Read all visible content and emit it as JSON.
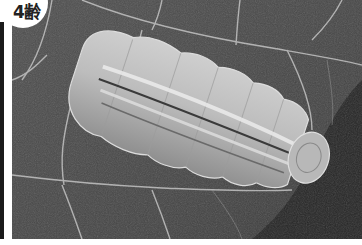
{
  "badge": {
    "label": "4齢"
  },
  "photo": {
    "subject": "caterpillar-on-leaf",
    "colors": {
      "leaf": "#4a4a4a",
      "leaf_dark": "#2a2a2a",
      "vein": "#c8c8c8",
      "body": "#b4b4b4",
      "body_highlight": "#e6e6e6",
      "stripe_dark": "#3c3c3c"
    }
  }
}
